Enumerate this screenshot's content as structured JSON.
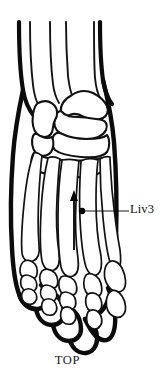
{
  "figure": {
    "view_caption": "TOP"
  },
  "annotations": {
    "point": {
      "label": "Liv3",
      "marker": "point-dot",
      "marker_x": 82,
      "marker_y": 211,
      "leader_from_x": 86,
      "leader_to_x": 129,
      "leader_y": 211,
      "label_x": 130,
      "label_y": 203
    },
    "direction_arrow": {
      "name": "needle-direction-arrow",
      "direction": "up",
      "x": 74,
      "y_top": 192,
      "y_bottom": 250
    }
  },
  "colors": {
    "outline": "#0b0b0b",
    "bone_stroke": "#111111",
    "fill": "#ffffff",
    "marker": "#000000",
    "text": "#111111",
    "background": "#ffffff"
  },
  "icons": {
    "point_marker": "filled-circle",
    "arrow": "arrow-up"
  }
}
